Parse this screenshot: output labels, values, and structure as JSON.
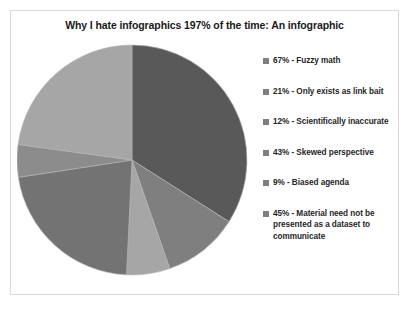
{
  "chart_data": {
    "type": "pie",
    "title": "Why I hate infographics 197% of the time: An infographic",
    "categories": [
      "Fuzzy math",
      "Only exists as link bait",
      "Scientifically inaccurate",
      "Skewed perspective",
      "Biased agenda",
      "Material need not be presented as a dataset to communicate"
    ],
    "values": [
      67,
      21,
      12,
      43,
      9,
      45
    ],
    "total": 197,
    "unit": "%",
    "legend_position": "right",
    "grid": false,
    "slice_colors": [
      "#595959",
      "#7f7f7f",
      "#a6a6a6",
      "#737373",
      "#8c8c8c",
      "#a6a6a6"
    ],
    "legend_entries": [
      "67% - Fuzzy math",
      "21% - Only exists as link bait",
      "12%  - Scientifically inaccurate",
      "43% - Skewed perspective",
      "9% - Biased agenda",
      "45% - Material need not be presented as a dataset to communicate"
    ]
  },
  "colors": {
    "frame_border": "#d9d9d9",
    "background": "#ffffff",
    "title_text": "#1a1a1a",
    "legend_text": "#262626",
    "legend_swatch": "#7f7f7f"
  }
}
